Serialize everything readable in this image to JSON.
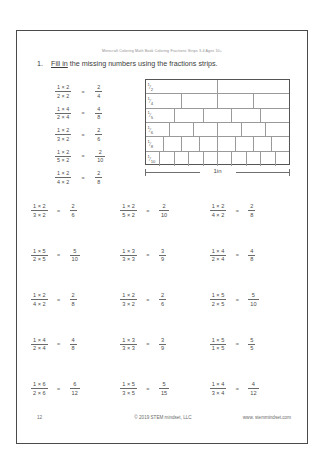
{
  "header_note": "Minecraft Coloring Math Book Coloring Fractions Strips 3-4 Ages 10+",
  "instruction": {
    "number": "1.",
    "underlined": "Fill in",
    "rest": " the missing numbers using the fractions strips."
  },
  "left_equations": [
    {
      "lnum": "1 × 2",
      "lden": "2 × 2",
      "eq": "=",
      "rnum": "2",
      "rden": "4"
    },
    {
      "lnum": "1 × 4",
      "lden": "2 × 4",
      "eq": "=",
      "rnum": "4",
      "rden": "8"
    },
    {
      "lnum": "1 × 2",
      "lden": "3 × 2",
      "eq": "=",
      "rnum": "2",
      "rden": "6"
    },
    {
      "lnum": "1 × 2",
      "lden": "5 × 2",
      "eq": "=",
      "rnum": "2",
      "rden": "10"
    },
    {
      "lnum": "1 × 2",
      "lden": "4 × 2",
      "eq": "=",
      "rnum": "2",
      "rden": "8"
    }
  ],
  "strips": {
    "rows": [
      {
        "label_num": "1",
        "label_den": "2",
        "cells": 2
      },
      {
        "label_num": "1",
        "label_den": "4",
        "cells": 4
      },
      {
        "label_num": "1",
        "label_den": "5",
        "cells": 5
      },
      {
        "label_num": "1",
        "label_den": "6",
        "cells": 6
      },
      {
        "label_num": "1",
        "label_den": "8",
        "cells": 8
      },
      {
        "label_num": "1",
        "label_den": "10",
        "cells": 10
      }
    ],
    "measure_label": "1in"
  },
  "grid": {
    "rows": [
      [
        {
          "lnum": "1 × 2",
          "lden": "3 × 2",
          "eq": "=",
          "rnum": "2",
          "rden": "6"
        },
        {
          "lnum": "1 × 2",
          "lden": "5 × 2",
          "eq": "=",
          "rnum": "2",
          "rden": "10"
        },
        {
          "lnum": "1 × 2",
          "lden": "4 × 2",
          "eq": "=",
          "rnum": "2",
          "rden": "8"
        }
      ],
      [
        {
          "lnum": "1 × 5",
          "lden": "2 × 5",
          "eq": "=",
          "rnum": "5",
          "rden": "10"
        },
        {
          "lnum": "1 × 3",
          "lden": "3 × 3",
          "eq": "=",
          "rnum": "3",
          "rden": "9"
        },
        {
          "lnum": "1 × 4",
          "lden": "2 × 4",
          "eq": "=",
          "rnum": "4",
          "rden": "8"
        }
      ],
      [
        {
          "lnum": "1 × 2",
          "lden": "4 × 2",
          "eq": "=",
          "rnum": "2",
          "rden": "8"
        },
        {
          "lnum": "1 × 2",
          "lden": "3 × 2",
          "eq": "=",
          "rnum": "2",
          "rden": "6"
        },
        {
          "lnum": "1 × 5",
          "lden": "2 × 5",
          "eq": "=",
          "rnum": "5",
          "rden": "10"
        }
      ],
      [
        {
          "lnum": "1 × 4",
          "lden": "2 × 4",
          "eq": "=",
          "rnum": "4",
          "rden": "8"
        },
        {
          "lnum": "1 × 3",
          "lden": "3 × 3",
          "eq": "=",
          "rnum": "3",
          "rden": "9"
        },
        {
          "lnum": "1 × 5",
          "lden": "1 × 5",
          "eq": "=",
          "rnum": "5",
          "rden": "5"
        }
      ],
      [
        {
          "lnum": "1 × 6",
          "lden": "2 × 6",
          "eq": "=",
          "rnum": "6",
          "rden": "12"
        },
        {
          "lnum": "1 × 5",
          "lden": "3 × 5",
          "eq": "=",
          "rnum": "5",
          "rden": "15"
        },
        {
          "lnum": "1 × 4",
          "lden": "3 × 4",
          "eq": "=",
          "rnum": "4",
          "rden": "12"
        }
      ]
    ]
  },
  "footer": {
    "page_number": "12",
    "copyright": "© 2019 STEM mindset, LLC",
    "website": "www. stemmindset.com"
  }
}
